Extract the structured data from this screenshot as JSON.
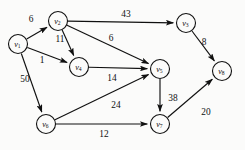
{
  "figure": {
    "background_color": "#fbfbfa",
    "stroke_color": "#101010",
    "width": 245,
    "height": 150
  },
  "graph": {
    "type": "directed-weighted-graph",
    "nodes": [
      {
        "id": "v1",
        "base": "v",
        "sub": "1",
        "x": 18,
        "y": 44,
        "r": 9.5
      },
      {
        "id": "v2",
        "base": "v",
        "sub": "2",
        "x": 58,
        "y": 21,
        "r": 9.5
      },
      {
        "id": "v3",
        "base": "v",
        "sub": "3",
        "x": 186,
        "y": 23,
        "r": 9.5
      },
      {
        "id": "v4",
        "base": "v",
        "sub": "4",
        "x": 79,
        "y": 67,
        "r": 9.5
      },
      {
        "id": "v5",
        "base": "v",
        "sub": "5",
        "x": 160,
        "y": 69,
        "r": 9.5
      },
      {
        "id": "v6",
        "base": "v",
        "sub": "6",
        "x": 46,
        "y": 124,
        "r": 9.5
      },
      {
        "id": "v7",
        "base": "v",
        "sub": "7",
        "x": 160,
        "y": 124,
        "r": 9.5
      },
      {
        "id": "v8",
        "base": "v",
        "sub": "8",
        "x": 222,
        "y": 71,
        "r": 9.5
      }
    ],
    "edges": [
      {
        "id": "e-v1-v2",
        "from": "v1",
        "to": "v2",
        "weight": 6,
        "label_x": 31,
        "label_y": 19
      },
      {
        "id": "e-v2-v3",
        "from": "v2",
        "to": "v3",
        "weight": 43,
        "label_x": 126,
        "label_y": 14
      },
      {
        "id": "e-v2-v4",
        "from": "v2",
        "to": "v4",
        "weight": 11,
        "label_x": 60,
        "label_y": 39
      },
      {
        "id": "e-v2-v5",
        "from": "v2",
        "to": "v5",
        "weight": 6,
        "label_x": 111,
        "label_y": 38
      },
      {
        "id": "e-v1-v4",
        "from": "v1",
        "to": "v4",
        "weight": 1,
        "label_x": 42,
        "label_y": 60
      },
      {
        "id": "e-v1-v6",
        "from": "v1",
        "to": "v6",
        "weight": 50,
        "label_x": 25,
        "label_y": 79
      },
      {
        "id": "e-v4-v5",
        "from": "v4",
        "to": "v5",
        "weight": 14,
        "label_x": 112,
        "label_y": 78
      },
      {
        "id": "e-v6-v5",
        "from": "v6",
        "to": "v5",
        "weight": 24,
        "label_x": 116,
        "label_y": 105
      },
      {
        "id": "e-v6-v7",
        "from": "v6",
        "to": "v7",
        "weight": 12,
        "label_x": 104,
        "label_y": 134
      },
      {
        "id": "e-v5-v7",
        "from": "v5",
        "to": "v7",
        "weight": 38,
        "label_x": 173,
        "label_y": 98
      },
      {
        "id": "e-v3-v8",
        "from": "v3",
        "to": "v8",
        "weight": 8,
        "label_x": 204,
        "label_y": 42
      },
      {
        "id": "e-v7-v8",
        "from": "v7",
        "to": "v8",
        "weight": 20,
        "label_x": 206,
        "label_y": 112
      }
    ]
  }
}
